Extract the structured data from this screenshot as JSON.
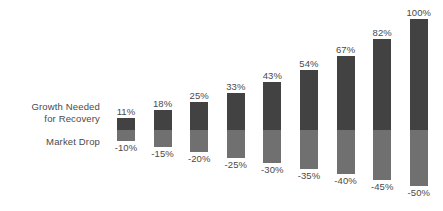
{
  "chart_data": {
    "type": "bar",
    "title": "",
    "subtitle": "",
    "xlabel": "",
    "ylabel": "",
    "grid": false,
    "legend_position": "left-axis-labels",
    "stacked": true,
    "baseline": 0,
    "ylim": [
      -50,
      100
    ],
    "categories": [
      "-10%",
      "-15%",
      "-20%",
      "-25%",
      "-30%",
      "-35%",
      "-40%",
      "-45%",
      "-50%"
    ],
    "series": [
      {
        "name": "Growth Needed for Recovery",
        "color": "#424242",
        "values": [
          11,
          18,
          25,
          33,
          43,
          54,
          67,
          82,
          100
        ],
        "labels": [
          "11%",
          "18%",
          "25%",
          "33%",
          "43%",
          "54%",
          "67%",
          "82%",
          "100%"
        ]
      },
      {
        "name": "Market Drop",
        "color": "#707070",
        "values": [
          -10,
          -15,
          -20,
          -25,
          -30,
          -35,
          -40,
          -45,
          -50
        ],
        "labels": [
          "-10%",
          "-15%",
          "-20%",
          "-25%",
          "-30%",
          "-35%",
          "-40%",
          "-45%",
          "-50%"
        ]
      }
    ]
  },
  "axis_labels": {
    "growth_line1": "Growth Needed",
    "growth_line2": "for Recovery",
    "drop": "Market Drop"
  },
  "colors": {
    "background": "#ffffff",
    "growth_bar": "#424242",
    "drop_bar": "#707070",
    "text": "#4a4a4a"
  }
}
